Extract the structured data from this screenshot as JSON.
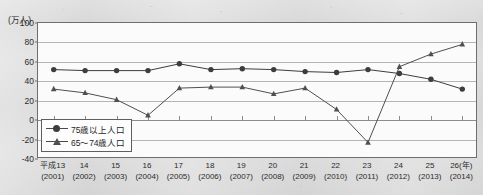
{
  "chart_data": {
    "type": "line",
    "title": "",
    "subtitle": "",
    "unit_label": "(万人)",
    "xlabel": "(年)",
    "ylabel": "",
    "ylim": [
      -40,
      100
    ],
    "ytick_step": 20,
    "yticks": [
      100,
      80,
      60,
      40,
      20,
      0,
      -20,
      -40
    ],
    "ytick_labels": [
      "100",
      "80",
      "60",
      "40",
      "20",
      "0",
      "-20",
      "-40"
    ],
    "grid": true,
    "legend_position": "bottom-left",
    "x_axis_unit_suffix": "(年)",
    "categories": [
      "平成13",
      "14",
      "15",
      "16",
      "17",
      "18",
      "19",
      "20",
      "21",
      "22",
      "23",
      "24",
      "25",
      "26"
    ],
    "x_sublabels": [
      "(2001)",
      "(2002)",
      "(2003)",
      "(2004)",
      "(2005)",
      "(2006)",
      "(2007)",
      "(2008)",
      "(2009)",
      "(2010)",
      "(2011)",
      "(2012)",
      "(2013)",
      "(2014)"
    ],
    "series": [
      {
        "name": "75歳以上人口",
        "marker": "circle",
        "color": "#3d3d3d",
        "values": [
          52,
          51,
          51,
          51,
          58,
          52,
          53,
          52,
          50,
          49,
          52,
          48,
          42,
          32
        ]
      },
      {
        "name": "65～74歳人口",
        "marker": "triangle",
        "color": "#4f4f4f",
        "values": [
          32,
          28,
          21,
          5,
          33,
          34,
          34,
          27,
          33,
          11,
          -23,
          55,
          68,
          78
        ]
      }
    ]
  },
  "legend": {
    "items": [
      {
        "label": "75歳以上人口",
        "marker": "circle"
      },
      {
        "label": "65～74歳人口",
        "marker": "triangle"
      }
    ]
  }
}
